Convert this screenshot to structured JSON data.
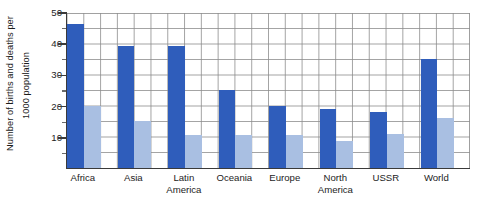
{
  "chart_data": {
    "type": "bar",
    "title": "",
    "subtitle": "",
    "xlabel": "",
    "ylabel": "Number of births and deaths per 1000 population",
    "ylabel_lines": [
      "Number of births and deaths per",
      "1000 population"
    ],
    "categories": [
      "Africa",
      "Asia",
      "Latin America",
      "Oceania",
      "Europe",
      "North America",
      "USSR",
      "World"
    ],
    "category_label_lines": [
      [
        "Africa"
      ],
      [
        "Asia"
      ],
      [
        "Latin",
        "America"
      ],
      [
        "Oceania"
      ],
      [
        "Europe"
      ],
      [
        "North",
        "America"
      ],
      [
        "USSR"
      ],
      [
        "World"
      ]
    ],
    "series": [
      {
        "name": "Birth rate",
        "color": "#2f5dbb",
        "values": [
          46,
          39,
          39,
          25,
          20,
          19,
          18,
          35
        ]
      },
      {
        "name": "Death rate",
        "color": "#a9bfe2",
        "values": [
          20,
          15,
          10.5,
          10.5,
          10.5,
          8.5,
          11,
          16
        ]
      }
    ],
    "ylim": [
      0,
      50
    ],
    "yticks": [
      10,
      20,
      30,
      40,
      50
    ],
    "ytick_labels": [
      "10",
      "20",
      "30",
      "40",
      "50"
    ],
    "yminor_ticks": [
      5,
      15,
      25,
      35,
      45
    ],
    "grid": true,
    "grid_color": "#8c8c8c",
    "legend": "none",
    "legend_position": "none"
  },
  "axes": {
    "axis_color": "#3a3a3a"
  }
}
